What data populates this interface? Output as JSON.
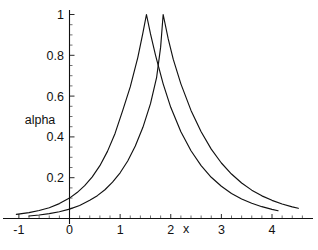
{
  "chart_data": {
    "type": "line",
    "title": "",
    "xlabel": "x",
    "ylabel": "alpha",
    "xlim": [
      -1.15,
      4.62
    ],
    "ylim": [
      0,
      1.06
    ],
    "grid": false,
    "legend": null,
    "x_ticks": [
      -1,
      0,
      1,
      2,
      3,
      4
    ],
    "x_tick_labels": [
      "-1",
      "0",
      "1",
      "2",
      "3",
      "4"
    ],
    "y_ticks": [
      0.2,
      0.4,
      0.6,
      0.8,
      1
    ],
    "y_tick_labels": [
      "0.2",
      "0.4",
      "0.6",
      "0.8",
      "1"
    ],
    "minor_ticks_per_interval": 5,
    "series": [
      {
        "name": "curve-left",
        "peak_x": 1.52,
        "peak_y": 1.0,
        "x_start": -1.05,
        "x_end": 4.12,
        "points": [
          [
            -1.05,
            0.02
          ],
          [
            -0.8,
            0.029
          ],
          [
            -0.6,
            0.039
          ],
          [
            -0.4,
            0.053
          ],
          [
            -0.2,
            0.073
          ],
          [
            0.0,
            0.1
          ],
          [
            0.15,
            0.127
          ],
          [
            0.3,
            0.161
          ],
          [
            0.45,
            0.204
          ],
          [
            0.6,
            0.259
          ],
          [
            0.75,
            0.329
          ],
          [
            0.9,
            0.417
          ],
          [
            1.05,
            0.529
          ],
          [
            1.2,
            0.645
          ],
          [
            1.35,
            0.79
          ],
          [
            1.45,
            0.91
          ],
          [
            1.52,
            1.0
          ],
          [
            1.6,
            0.905
          ],
          [
            1.7,
            0.8
          ],
          [
            1.85,
            0.66
          ],
          [
            2.0,
            0.545
          ],
          [
            2.2,
            0.425
          ],
          [
            2.4,
            0.332
          ],
          [
            2.6,
            0.259
          ],
          [
            2.8,
            0.202
          ],
          [
            3.0,
            0.158
          ],
          [
            3.2,
            0.123
          ],
          [
            3.4,
            0.096
          ],
          [
            3.6,
            0.075
          ],
          [
            3.8,
            0.058
          ],
          [
            4.0,
            0.045
          ],
          [
            4.12,
            0.038
          ]
        ]
      },
      {
        "name": "curve-right",
        "peak_x": 1.85,
        "peak_y": 1.0,
        "x_start": -0.8,
        "x_end": 4.52,
        "points": [
          [
            -0.8,
            0.012
          ],
          [
            -0.6,
            0.017
          ],
          [
            -0.4,
            0.024
          ],
          [
            -0.2,
            0.033
          ],
          [
            0.0,
            0.046
          ],
          [
            0.2,
            0.064
          ],
          [
            0.4,
            0.089
          ],
          [
            0.55,
            0.112
          ],
          [
            0.7,
            0.141
          ],
          [
            0.85,
            0.178
          ],
          [
            1.0,
            0.224
          ],
          [
            1.15,
            0.282
          ],
          [
            1.3,
            0.355
          ],
          [
            1.45,
            0.447
          ],
          [
            1.6,
            0.563
          ],
          [
            1.72,
            0.69
          ],
          [
            1.8,
            0.84
          ],
          [
            1.85,
            1.0
          ],
          [
            1.95,
            0.88
          ],
          [
            2.05,
            0.78
          ],
          [
            2.2,
            0.66
          ],
          [
            2.4,
            0.53
          ],
          [
            2.6,
            0.425
          ],
          [
            2.8,
            0.34
          ],
          [
            3.0,
            0.272
          ],
          [
            3.2,
            0.218
          ],
          [
            3.4,
            0.174
          ],
          [
            3.6,
            0.139
          ],
          [
            3.8,
            0.111
          ],
          [
            4.0,
            0.089
          ],
          [
            4.2,
            0.071
          ],
          [
            4.4,
            0.057
          ],
          [
            4.52,
            0.05
          ]
        ]
      }
    ]
  },
  "axes": {
    "x_axis_name": "x-axis",
    "y_axis_name": "y-axis",
    "x_label_text": "x",
    "y_label_text": "alpha"
  }
}
